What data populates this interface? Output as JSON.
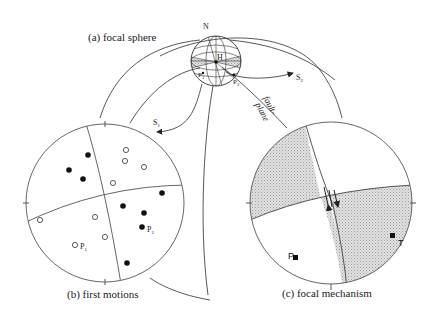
{
  "panels": {
    "a": {
      "label": "(a) focal sphere",
      "north": "N",
      "hypocenter": "H",
      "p1": "P",
      "p1_sub": "1",
      "p2": "P",
      "p2_sub": "2",
      "s1": "S",
      "s1_sub": "1",
      "s2": "S",
      "s2_sub": "2",
      "fault_plane_line1": "fault-",
      "fault_plane_line2": "plane"
    },
    "b": {
      "label": "(b) first motions",
      "p1": "P",
      "p1_sub": "1",
      "p2": "P",
      "p2_sub": "2",
      "legend": {
        "filled": "compression",
        "open": "dilatation"
      }
    },
    "c": {
      "label": "(c) focal mechanism",
      "p_axis": "P",
      "t_axis": "T"
    }
  },
  "colors": {
    "line": "#444444",
    "shade": "#d6d6d6",
    "dot": "#111111"
  }
}
